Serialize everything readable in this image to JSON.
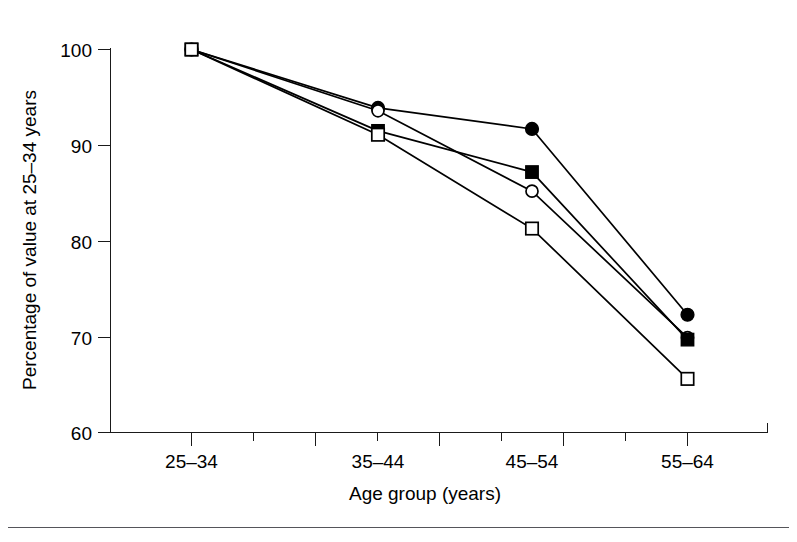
{
  "chart_data": {
    "type": "line",
    "title": "",
    "xlabel": "Age group (years)",
    "ylabel": "Percentage of value at 25–34 years",
    "categories": [
      "25–34",
      "35–44",
      "45–54",
      "55–64"
    ],
    "ylim": [
      60,
      100
    ],
    "yticks": [
      60,
      70,
      80,
      90,
      100
    ],
    "ytick_labels": [
      "60",
      "70",
      "80",
      "90",
      "100"
    ],
    "grid": false,
    "legend": "none",
    "minor_ticks_x": true,
    "series": [
      {
        "name": "series-filled-circle",
        "marker": "filled-circle",
        "values": [
          100.0,
          93.9,
          91.7,
          72.3
        ]
      },
      {
        "name": "series-open-circle",
        "marker": "open-circle",
        "values": [
          100.0,
          93.6,
          85.2,
          69.9
        ]
      },
      {
        "name": "series-filled-square",
        "marker": "filled-square",
        "values": [
          100.0,
          91.5,
          87.2,
          69.7
        ]
      },
      {
        "name": "series-open-square",
        "marker": "open-square",
        "values": [
          100.0,
          91.1,
          81.3,
          65.6
        ]
      }
    ]
  },
  "axes": {
    "y_title": "Percentage of value at 25–34 years",
    "x_title": "Age group (years)",
    "y_tick_labels": [
      "100",
      "90",
      "80",
      "70",
      "60"
    ],
    "x_tick_labels": [
      "25–34",
      "35–44",
      "45–54",
      "55–64"
    ]
  },
  "colors": {
    "ink": "#000000",
    "axis": "#1a1a1a",
    "background": "#ffffff",
    "footer_rule": "#55555a"
  }
}
